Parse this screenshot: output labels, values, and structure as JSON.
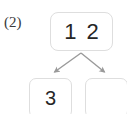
{
  "figure": {
    "item_label": "(2)",
    "background_color": "#ffffff",
    "box_border_color": "#dedede",
    "box_fill_color": "#ffffff",
    "text_color": "#262626",
    "arrow_color": "#9a9a9a"
  },
  "diagram": {
    "type": "number-bond",
    "whole": {
      "label": "whole",
      "value": "1 2"
    },
    "parts": [
      {
        "label": "part-left",
        "value": "3"
      },
      {
        "label": "part-right",
        "value": ""
      }
    ]
  },
  "arrows": [
    {
      "name": "arrow-to-left-part",
      "from": "whole",
      "to": "part-left",
      "direction": "down-left"
    },
    {
      "name": "arrow-to-right-part",
      "from": "whole",
      "to": "part-right",
      "direction": "down-right"
    }
  ]
}
